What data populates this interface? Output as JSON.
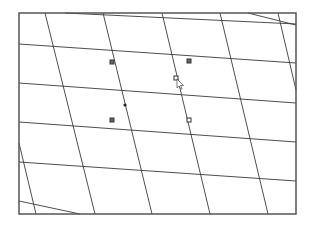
{
  "canvas": {
    "frame": {
      "x": 19,
      "y": 13,
      "width": 277,
      "height": 201,
      "stroke": "#555555"
    },
    "grid_color": "#3a3a3a",
    "shallow_lines": [
      {
        "x1": 65,
        "y1": 13,
        "x2": 296,
        "y2": 24
      },
      {
        "x1": 248,
        "y1": 13,
        "x2": 296,
        "y2": 25
      },
      {
        "x1": 19,
        "y1": 44,
        "x2": 296,
        "y2": 63
      },
      {
        "x1": 19,
        "y1": 83,
        "x2": 296,
        "y2": 103
      },
      {
        "x1": 19,
        "y1": 122,
        "x2": 296,
        "y2": 142
      },
      {
        "x1": 19,
        "y1": 162,
        "x2": 296,
        "y2": 181
      },
      {
        "x1": 19,
        "y1": 201,
        "x2": 80,
        "y2": 214
      }
    ],
    "steep_lines": [
      {
        "x1": 19,
        "y1": 143,
        "x2": 36,
        "y2": 214
      },
      {
        "x1": 45,
        "y1": 13,
        "x2": 95,
        "y2": 214
      },
      {
        "x1": 103,
        "y1": 13,
        "x2": 152,
        "y2": 214
      },
      {
        "x1": 162,
        "y1": 13,
        "x2": 210,
        "y2": 214
      },
      {
        "x1": 220,
        "y1": 13,
        "x2": 268,
        "y2": 214
      },
      {
        "x1": 278,
        "y1": 13,
        "x2": 296,
        "y2": 90
      }
    ],
    "markers": [
      {
        "type": "square",
        "x": 112,
        "y": 62
      },
      {
        "type": "square",
        "x": 189,
        "y": 61
      },
      {
        "type": "hollow-square",
        "x": 176,
        "y": 78
      },
      {
        "type": "dot",
        "x": 125,
        "y": 105
      },
      {
        "type": "square",
        "x": 112,
        "y": 120
      },
      {
        "type": "hollow-square",
        "x": 189,
        "y": 120
      }
    ],
    "cursor": {
      "x": 177,
      "y": 79
    }
  }
}
